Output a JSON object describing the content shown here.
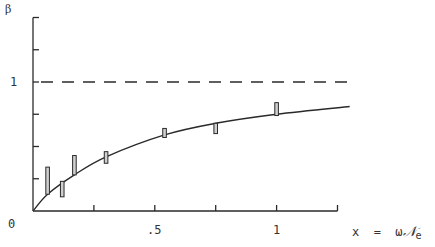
{
  "chart_data": {
    "type": "line",
    "title": "",
    "xlabel": "x = ωN_e",
    "ylabel": "β",
    "xlim": [
      0,
      1.25
    ],
    "ylim": [
      0,
      1.5
    ],
    "grid": false,
    "x_ticks": [
      0,
      0.25,
      0.5,
      0.75,
      1.0,
      1.25
    ],
    "x_tick_labels": [
      "",
      "",
      ".5",
      "",
      "1",
      ""
    ],
    "y_ticks": [
      0,
      0.25,
      0.5,
      0.75,
      1.0,
      1.25,
      1.5
    ],
    "y_tick_labels": [
      "0",
      "",
      "",
      "",
      "1",
      "",
      ""
    ],
    "reference_line": {
      "y": 1.0,
      "style": "dashed",
      "x_range": [
        0,
        1.3
      ]
    },
    "series": [
      {
        "name": "theory curve",
        "kind": "line",
        "x": [
          0,
          0.06,
          0.17,
          0.3,
          0.54,
          0.75,
          1.0,
          1.3
        ],
        "y": [
          0,
          0.13,
          0.28,
          0.42,
          0.59,
          0.68,
          0.75,
          0.81
        ]
      },
      {
        "name": "measurements",
        "kind": "error-bars",
        "x": [
          0.06,
          0.12,
          0.17,
          0.3,
          0.54,
          0.75,
          1.0
        ],
        "y_low": [
          0.13,
          0.11,
          0.28,
          0.37,
          0.57,
          0.6,
          0.74
        ],
        "y_high": [
          0.34,
          0.23,
          0.43,
          0.46,
          0.64,
          0.68,
          0.84
        ]
      }
    ]
  },
  "labels": {
    "y_axis_symbol": "β",
    "y_one": "1",
    "origin": "0",
    "x_half": ".5",
    "x_one": "1",
    "x_axis_eq": "x  =  ω",
    "x_axis_script": "𝒩",
    "x_axis_sub": "e"
  },
  "colors": {
    "ink": "#2a2a2a",
    "bar_fill": "#cfcfcf",
    "background": "#ffffff"
  }
}
